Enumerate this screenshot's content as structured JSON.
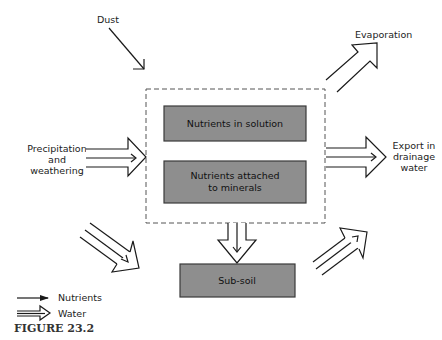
{
  "diagram": {
    "figure_label": "FIGURE 23.2",
    "inputs": {
      "dust": "Dust",
      "precipitation": [
        "Precipitation",
        "and",
        "weathering"
      ]
    },
    "outputs": {
      "evaporation": "Evaporation",
      "export": [
        "Export in",
        "drainage",
        "water"
      ]
    },
    "compartments": {
      "solution": "Nutrients in solution",
      "attached": [
        "Nutrients attached",
        "to minerals"
      ],
      "subsoil": "Sub-soil"
    },
    "legend": {
      "nutrients": "Nutrients",
      "water": "Water"
    },
    "colors": {
      "box_fill": "#8e8e8e",
      "line": "#1a1a1a"
    }
  }
}
